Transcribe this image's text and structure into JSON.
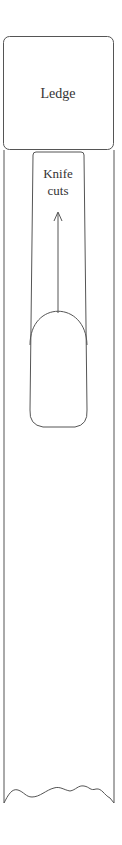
{
  "diagram": {
    "ledge": {
      "label": "Ledge"
    },
    "knife_slot": {
      "label_line1": "Knife",
      "label_line2": "cuts"
    },
    "colors": {
      "stroke": "#555555",
      "text": "#333333",
      "background": "#ffffff"
    }
  }
}
